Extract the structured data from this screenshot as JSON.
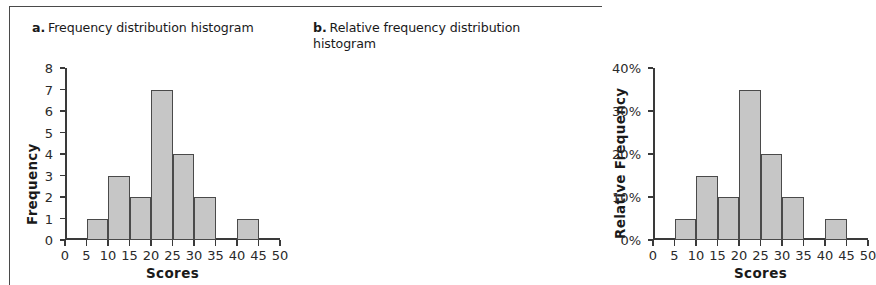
{
  "figure": {
    "panels": [
      {
        "letter": "a.",
        "title": "Frequency distribution histogram",
        "name": "frequency-histogram"
      },
      {
        "letter": "b.",
        "title": "Relative frequency distribution histogram",
        "name": "relative-frequency-histogram"
      }
    ]
  },
  "chart_data": [
    {
      "type": "bar",
      "title": "Frequency distribution histogram",
      "panel_letter": "a.",
      "xlabel": "Scores",
      "ylabel": "Frequency",
      "xlim": [
        0,
        50
      ],
      "ylim": [
        0,
        8
      ],
      "xticks": [
        "0",
        "5",
        "10",
        "15",
        "20",
        "25",
        "30",
        "35",
        "40",
        "45",
        "50"
      ],
      "xtick_values": [
        0,
        5,
        10,
        15,
        20,
        25,
        30,
        35,
        40,
        45,
        50
      ],
      "yticks": [
        "0",
        "1",
        "2",
        "3",
        "4",
        "5",
        "6",
        "7",
        "8"
      ],
      "ytick_values": [
        0,
        1,
        2,
        3,
        4,
        5,
        6,
        7,
        8
      ],
      "bin_width": 5,
      "grid": false,
      "legend": null,
      "bars": [
        {
          "bin_start": 5,
          "bin_end": 10,
          "value": 1
        },
        {
          "bin_start": 10,
          "bin_end": 15,
          "value": 3
        },
        {
          "bin_start": 15,
          "bin_end": 20,
          "value": 2
        },
        {
          "bin_start": 20,
          "bin_end": 25,
          "value": 7
        },
        {
          "bin_start": 25,
          "bin_end": 30,
          "value": 4
        },
        {
          "bin_start": 30,
          "bin_end": 35,
          "value": 2
        },
        {
          "bin_start": 40,
          "bin_end": 45,
          "value": 1
        }
      ],
      "categories": [
        "5-10",
        "10-15",
        "15-20",
        "20-25",
        "25-30",
        "30-35",
        "40-45"
      ],
      "values": [
        1,
        3,
        2,
        7,
        4,
        2,
        1
      ],
      "bar_fill": "#c6c6c6",
      "bar_stroke": "#4a4a4a"
    },
    {
      "type": "bar",
      "title": "Relative frequency distribution histogram",
      "panel_letter": "b.",
      "xlabel": "Scores",
      "ylabel": "Relative Frequency",
      "xlim": [
        0,
        50
      ],
      "ylim": [
        0,
        40
      ],
      "xticks": [
        "0",
        "5",
        "10",
        "15",
        "20",
        "25",
        "30",
        "35",
        "40",
        "45",
        "50"
      ],
      "xtick_values": [
        0,
        5,
        10,
        15,
        20,
        25,
        30,
        35,
        40,
        45,
        50
      ],
      "yticks": [
        "0%",
        "10%",
        "20%",
        "30%",
        "40%"
      ],
      "ytick_values": [
        0,
        10,
        20,
        30,
        40
      ],
      "bin_width": 5,
      "grid": false,
      "legend": null,
      "bars": [
        {
          "bin_start": 5,
          "bin_end": 10,
          "value": 5
        },
        {
          "bin_start": 10,
          "bin_end": 15,
          "value": 15
        },
        {
          "bin_start": 15,
          "bin_end": 20,
          "value": 10
        },
        {
          "bin_start": 20,
          "bin_end": 25,
          "value": 35
        },
        {
          "bin_start": 25,
          "bin_end": 30,
          "value": 20
        },
        {
          "bin_start": 30,
          "bin_end": 35,
          "value": 10
        },
        {
          "bin_start": 40,
          "bin_end": 45,
          "value": 5
        }
      ],
      "categories": [
        "5-10",
        "10-15",
        "15-20",
        "20-25",
        "25-30",
        "30-35",
        "40-45"
      ],
      "values": [
        5,
        15,
        10,
        35,
        20,
        10,
        5
      ],
      "bar_fill": "#c6c6c6",
      "bar_stroke": "#4a4a4a"
    }
  ]
}
